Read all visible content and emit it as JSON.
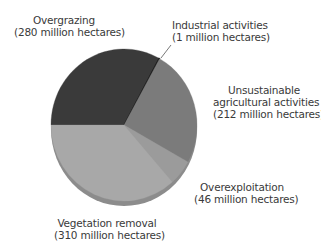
{
  "chart_data": {
    "type": "pie",
    "title": "",
    "unit": "million hectares",
    "total": 849,
    "start_angle_deg": 180,
    "direction": "clockwise",
    "slices": [
      {
        "name": "Overgrazing",
        "value": 280,
        "value_label": "(280 million hectares)",
        "color": "#3a3a3a"
      },
      {
        "name": "Industrial activities",
        "value": 1,
        "value_label": "(1 million hectares)",
        "color": "#1a1a1a"
      },
      {
        "name": "Unsustainable agricultural activities",
        "value": 212,
        "value_label": "(212 million hectares)",
        "color": "#7b7b7b"
      },
      {
        "name": "Overexploitation",
        "value": 46,
        "value_label": "(46 million hectares)",
        "color": "#9b9b9b"
      },
      {
        "name": "Vegetation removal",
        "value": 310,
        "value_label": "(310 million hectares)",
        "color": "#a8a8a8"
      }
    ],
    "legend": "none (direct labels)"
  },
  "labels": {
    "overgrazing": {
      "line1": "Overgrazing",
      "line2": "(280 million hectares)"
    },
    "industrial": {
      "line1": "Industrial activities",
      "line2": "(1 million hectares)"
    },
    "unsustainable": {
      "line1": "Unsustainable",
      "line2": "agricultural activities",
      "line3": "(212 million hectares)"
    },
    "overexploitation": {
      "line1": "Overexploitation",
      "line2": "(46 million hectares)"
    },
    "vegetation": {
      "line1": "Vegetation removal",
      "line2": "(310 million hectares)"
    }
  }
}
